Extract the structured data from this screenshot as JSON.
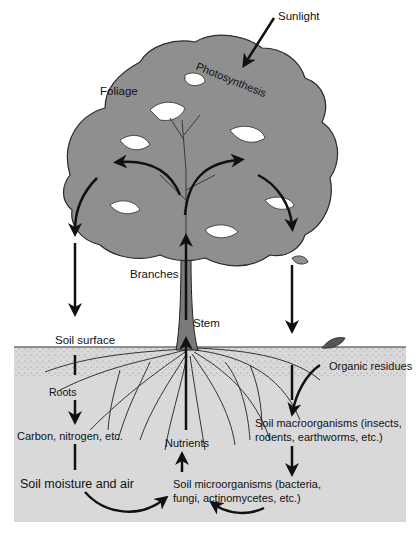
{
  "diagram": {
    "type": "nutrient-cycle-illustration",
    "colors": {
      "background": "#ffffff",
      "foliage": "#8f8f8f",
      "foliage_outline": "#2a2a2a",
      "stem": "#7a7a7a",
      "soil": "#d9d9d9",
      "arrow": "#111111",
      "text": "#111111"
    },
    "labels": {
      "sunlight": "Sunlight",
      "photosynthesis": "Photosynthesis",
      "foliage": "Foliage",
      "branches": "Branches",
      "stem": "Stem",
      "soil_surface": "Soil surface",
      "organic_residues": "Organic residues",
      "roots": "Roots",
      "carbon_nitrogen": "Carbon, nitrogen, etc.",
      "nutrients": "Nutrients",
      "macroorganisms_line1": "Soil macroorganisms (insects,",
      "macroorganisms_line2": "rodents, earthworms, etc.)",
      "soil_moisture_air": "Soil moisture and air",
      "microorganisms_line1": "Soil microorganisms (bacteria,",
      "microorganisms_line2": "fungi, actinomycetes, etc.)"
    },
    "flows": [
      {
        "from": "Sunlight",
        "to": "Photosynthesis"
      },
      {
        "from": "Stem",
        "to": "Foliage (left branch)"
      },
      {
        "from": "Stem",
        "to": "Foliage (right branch)"
      },
      {
        "from": "Foliage",
        "to": "Soil surface"
      },
      {
        "from": "Foliage",
        "to": "Organic residues"
      },
      {
        "from": "Soil surface",
        "to": "Carbon, nitrogen, etc."
      },
      {
        "from": "Carbon, nitrogen, etc.",
        "to": "Soil moisture and air"
      },
      {
        "from": "Soil moisture and air",
        "to": "Soil microorganisms"
      },
      {
        "from": "Organic residues",
        "to": "Soil macroorganisms"
      },
      {
        "from": "Soil macroorganisms",
        "to": "Soil microorganisms"
      },
      {
        "from": "Soil microorganisms",
        "to": "Nutrients"
      },
      {
        "from": "Nutrients",
        "to": "Stem"
      }
    ]
  }
}
